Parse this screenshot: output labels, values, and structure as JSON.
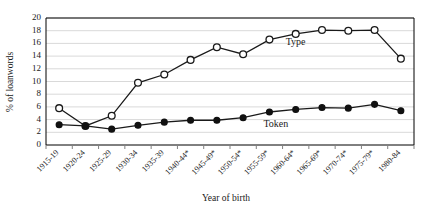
{
  "chart_data": {
    "type": "line",
    "title": "",
    "xlabel": "Year of birth",
    "ylabel": "% of loanwords",
    "ylim": [
      0,
      20
    ],
    "yticks": [
      0,
      2,
      4,
      6,
      8,
      10,
      12,
      14,
      16,
      18,
      20
    ],
    "grid": true,
    "legend_position": "inline-annotation",
    "categories": [
      "1915-19",
      "1920-24",
      "1925-29",
      "1930-34",
      "1935-39",
      "1940-44*",
      "1945-49*",
      "1950-54*",
      "1955-59*",
      "1960-64*",
      "1965-69*",
      "1970-74*",
      "1975-79*",
      "1980-84"
    ],
    "series": [
      {
        "name": "Type",
        "marker": "open-circle",
        "values": [
          5.8,
          3.0,
          4.6,
          9.8,
          11.1,
          13.4,
          15.4,
          14.3,
          16.6,
          17.5,
          18.1,
          18.0,
          18.1,
          13.6
        ]
      },
      {
        "name": "Token",
        "marker": "filled-circle",
        "values": [
          3.2,
          3.0,
          2.5,
          3.1,
          3.6,
          3.9,
          3.9,
          4.3,
          5.2,
          5.6,
          5.9,
          5.8,
          6.4,
          5.4
        ]
      }
    ],
    "annotations": [
      {
        "text": "Type",
        "series": "Type"
      },
      {
        "text": "Token",
        "series": "Token"
      }
    ]
  },
  "colors": {
    "line": "#1a1a1a",
    "grid": "#d9d9d9",
    "axis": "#000000",
    "marker_fill_open": "#ffffff",
    "marker_fill_closed": "#111111",
    "background": "#ffffff"
  }
}
